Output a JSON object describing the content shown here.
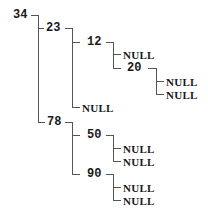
{
  "tree": {
    "root": "34",
    "nodes": [
      {
        "id": "n34",
        "label": "34",
        "x": 13,
        "y": 15,
        "type": "value"
      },
      {
        "id": "n23",
        "label": "23",
        "x": 46,
        "y": 28,
        "type": "value"
      },
      {
        "id": "n12",
        "label": "12",
        "x": 87,
        "y": 42,
        "type": "value"
      },
      {
        "id": "n12L",
        "label": "NULL",
        "x": 123,
        "y": 54,
        "type": "null"
      },
      {
        "id": "n20",
        "label": "20",
        "x": 127,
        "y": 68,
        "type": "value"
      },
      {
        "id": "n20L",
        "label": "NULL",
        "x": 166,
        "y": 81,
        "type": "null"
      },
      {
        "id": "n20R",
        "label": "NULL",
        "x": 166,
        "y": 94,
        "type": "null"
      },
      {
        "id": "n23R",
        "label": "NULL",
        "x": 82,
        "y": 107,
        "type": "null"
      },
      {
        "id": "n78",
        "label": "78",
        "x": 47,
        "y": 122,
        "type": "value"
      },
      {
        "id": "n50",
        "label": "50",
        "x": 87,
        "y": 135,
        "type": "value"
      },
      {
        "id": "n50L",
        "label": "NULL",
        "x": 123,
        "y": 148,
        "type": "null"
      },
      {
        "id": "n50R",
        "label": "NULL",
        "x": 123,
        "y": 161,
        "type": "null"
      },
      {
        "id": "n90",
        "label": "90",
        "x": 87,
        "y": 174,
        "type": "value"
      },
      {
        "id": "n90L",
        "label": "NULL",
        "x": 123,
        "y": 187,
        "type": "null"
      },
      {
        "id": "n90R",
        "label": "NULL",
        "x": 123,
        "y": 200,
        "type": "null"
      }
    ],
    "edges": [
      [
        "34",
        "23"
      ],
      [
        "34",
        "78"
      ],
      [
        "23",
        "12"
      ],
      [
        "23",
        "NULL"
      ],
      [
        "12",
        "NULL"
      ],
      [
        "12",
        "20"
      ],
      [
        "20",
        "NULL"
      ],
      [
        "20",
        "NULL"
      ],
      [
        "78",
        "50"
      ],
      [
        "78",
        "90"
      ],
      [
        "50",
        "NULL"
      ],
      [
        "50",
        "NULL"
      ],
      [
        "90",
        "NULL"
      ],
      [
        "90",
        "NULL"
      ]
    ],
    "line_color": "#555555",
    "text_color": "#1a1a1a"
  }
}
